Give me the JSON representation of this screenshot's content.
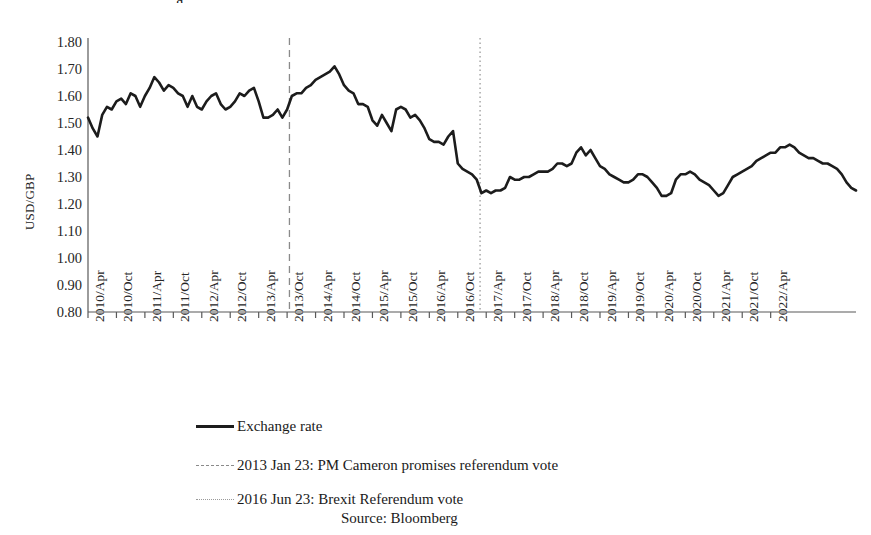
{
  "figure": {
    "background": "#ffffff",
    "line_color": "#1c1c1c",
    "event_line_color": "#8a8a8a",
    "axis_color": "#595959",
    "partial_title": "g"
  },
  "chart_data": {
    "type": "line",
    "title": "",
    "xlabel": "",
    "ylabel": "USD/GBP",
    "ylim": [
      0.8,
      1.8
    ],
    "ytick_labels": [
      "1.80",
      "1.70",
      "1.60",
      "1.50",
      "1.40",
      "1.30",
      "1.20",
      "1.10",
      "1.00",
      "0.90",
      "0.80"
    ],
    "ytick_values": [
      1.8,
      1.7,
      1.6,
      1.5,
      1.4,
      1.3,
      1.2,
      1.1,
      1.0,
      0.9,
      0.8
    ],
    "grid": false,
    "legend_position": "below-plot",
    "xtick_labels": [
      "2010/Apr",
      "2010/Oct",
      "2011/Apr",
      "2011/Oct",
      "2012/Apr",
      "2012/Oct",
      "2013/Apr",
      "2013/Oct",
      "2014/Apr",
      "2014/Oct",
      "2015/Apr",
      "2015/Oct",
      "2016/Apr",
      "2016/Oct",
      "2017/Apr",
      "2017/Oct",
      "2018/Apr",
      "2018/Oct",
      "2019/Apr",
      "2019/Oct",
      "2020/Apr",
      "2020/Oct",
      "2021/Apr",
      "2021/Oct",
      "2022/Apr"
    ],
    "x_start": "2010/Apr",
    "x_end": "2022/Apr",
    "x_step_months": 1,
    "series": [
      {
        "name": "Exchange rate",
        "style": "solid",
        "color": "#1c1c1c",
        "values": [
          1.52,
          1.48,
          1.45,
          1.53,
          1.56,
          1.55,
          1.58,
          1.59,
          1.57,
          1.61,
          1.6,
          1.56,
          1.6,
          1.63,
          1.67,
          1.65,
          1.62,
          1.64,
          1.63,
          1.61,
          1.6,
          1.56,
          1.6,
          1.56,
          1.55,
          1.58,
          1.6,
          1.61,
          1.57,
          1.55,
          1.56,
          1.58,
          1.61,
          1.6,
          1.62,
          1.63,
          1.58,
          1.52,
          1.52,
          1.53,
          1.55,
          1.52,
          1.55,
          1.6,
          1.61,
          1.61,
          1.63,
          1.64,
          1.66,
          1.67,
          1.68,
          1.69,
          1.71,
          1.68,
          1.64,
          1.62,
          1.61,
          1.57,
          1.57,
          1.56,
          1.51,
          1.49,
          1.53,
          1.5,
          1.47,
          1.55,
          1.56,
          1.55,
          1.52,
          1.53,
          1.51,
          1.48,
          1.44,
          1.43,
          1.43,
          1.42,
          1.45,
          1.47,
          1.35,
          1.33,
          1.32,
          1.31,
          1.29,
          1.24,
          1.25,
          1.24,
          1.25,
          1.25,
          1.26,
          1.3,
          1.29,
          1.29,
          1.3,
          1.3,
          1.31,
          1.32,
          1.32,
          1.32,
          1.33,
          1.35,
          1.35,
          1.34,
          1.35,
          1.39,
          1.41,
          1.38,
          1.4,
          1.37,
          1.34,
          1.33,
          1.31,
          1.3,
          1.29,
          1.28,
          1.28,
          1.29,
          1.31,
          1.31,
          1.3,
          1.28,
          1.26,
          1.23,
          1.23,
          1.24,
          1.29,
          1.31,
          1.31,
          1.32,
          1.31,
          1.29,
          1.28,
          1.27,
          1.25,
          1.23,
          1.24,
          1.27,
          1.3,
          1.31,
          1.32,
          1.33,
          1.34,
          1.36,
          1.37,
          1.38,
          1.39,
          1.39,
          1.41,
          1.41,
          1.42,
          1.41,
          1.39,
          1.38,
          1.37,
          1.37,
          1.36,
          1.35,
          1.35,
          1.34,
          1.33,
          1.31,
          1.28,
          1.26,
          1.25
        ]
      }
    ],
    "event_lines": [
      {
        "label": "2013 Jan 23: PM Cameron promises referendum vote",
        "date": "2013 Jan 23",
        "style": "dashed",
        "color": "#8a8a8a",
        "x_fraction": 0.2623
      },
      {
        "label": "2016 Jun 23: Brexit Referendum vote",
        "date": "2016 Jun 23",
        "style": "dotted",
        "color": "#9a9a9a",
        "x_fraction": 0.5105
      }
    ]
  },
  "legend": {
    "items": [
      {
        "label": "Exchange rate",
        "style": "solid"
      },
      {
        "label": "2013 Jan 23: PM Cameron promises referendum vote",
        "style": "dashed"
      },
      {
        "label": "2016 Jun 23: Brexit Referendum vote",
        "style": "dotted"
      }
    ]
  },
  "source": "Source: Bloomberg"
}
